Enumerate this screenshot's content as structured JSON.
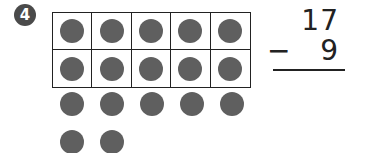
{
  "problem_number": "4",
  "ten_frame": {
    "filled": 10,
    "total": 10
  },
  "loose_counters": 7,
  "subtraction": {
    "minuend": "17",
    "operator": "−",
    "subtrahend": "9"
  },
  "colors": {
    "counter": "#5f5f5f",
    "badge": "#4a4a4a",
    "grid": "#222222"
  }
}
